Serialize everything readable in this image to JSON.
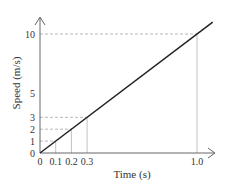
{
  "chart_data": {
    "type": "line",
    "title": "",
    "xlabel": "Time (s)",
    "ylabel": "Speed (m/s)",
    "x_ticks": [
      0,
      0.1,
      0.2,
      0.3,
      1.0
    ],
    "x_tick_labels": [
      "0",
      "0.1",
      "0.2",
      "0.3",
      "1.0"
    ],
    "y_ticks": [
      0,
      1,
      2,
      3,
      5,
      10
    ],
    "y_tick_labels": [
      "0",
      "1",
      "2",
      "3",
      "5",
      "10"
    ],
    "series": [
      {
        "name": "speed",
        "x": [
          0,
          1.1
        ],
        "y": [
          0,
          11
        ]
      }
    ],
    "marked_points": [
      {
        "x": 0.1,
        "y": 1
      },
      {
        "x": 0.2,
        "y": 2
      },
      {
        "x": 0.3,
        "y": 3
      },
      {
        "x": 1.0,
        "y": 10
      }
    ],
    "grid": false,
    "legend": "none"
  }
}
